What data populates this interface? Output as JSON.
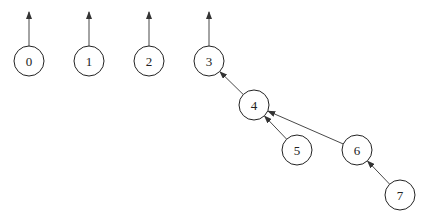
{
  "diagram": {
    "type": "union-find forest (parent pointers)",
    "colors": {
      "stroke": "#222222",
      "background": "#ffffff"
    },
    "node_radius": 15,
    "nodes": [
      {
        "id": "0",
        "label": "0",
        "x": 29,
        "y": 61
      },
      {
        "id": "1",
        "label": "1",
        "x": 89,
        "y": 61
      },
      {
        "id": "2",
        "label": "2",
        "x": 149,
        "y": 61
      },
      {
        "id": "3",
        "label": "3",
        "x": 209,
        "y": 61
      },
      {
        "id": "4",
        "label": "4",
        "x": 254,
        "y": 105
      },
      {
        "id": "5",
        "label": "5",
        "x": 297,
        "y": 150
      },
      {
        "id": "6",
        "label": "6",
        "x": 357,
        "y": 150
      },
      {
        "id": "7",
        "label": "7",
        "x": 400,
        "y": 195
      }
    ],
    "root_arrows": [
      {
        "from": "0",
        "to_y": 12
      },
      {
        "from": "1",
        "to_y": 12
      },
      {
        "from": "2",
        "to_y": 12
      },
      {
        "from": "3",
        "to_y": 12
      }
    ],
    "edges": [
      {
        "from": "4",
        "to": "3"
      },
      {
        "from": "5",
        "to": "4"
      },
      {
        "from": "6",
        "to": "4"
      },
      {
        "from": "7",
        "to": "6"
      }
    ]
  }
}
